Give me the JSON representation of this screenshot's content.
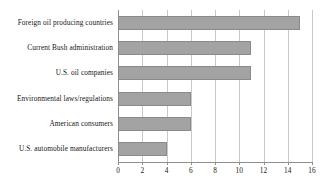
{
  "chart_data": {
    "type": "bar",
    "orientation": "horizontal",
    "title": "",
    "subtitle": "",
    "xlabel": "",
    "ylabel": "",
    "categories": [
      "Foreign oil producing countries",
      "Current Bush administration",
      "U.S. oil companies",
      "Environmental laws/regulations",
      "American consumers",
      "U.S. automobile manufacturers"
    ],
    "values": [
      15,
      11,
      11,
      6,
      6,
      4
    ],
    "xlim": [
      0,
      16
    ],
    "xticks": [
      0,
      2,
      4,
      6,
      8,
      10,
      12,
      14,
      16
    ],
    "xtick_labels": [
      "0",
      "2",
      "4",
      "6",
      "8",
      "10",
      "12",
      "14",
      "16"
    ],
    "grid": true,
    "grid_axis": "x",
    "legend": false,
    "legend_position": "none",
    "annotations": [],
    "series": [
      {
        "name": "",
        "values": [
          15,
          11,
          11,
          6,
          6,
          4
        ]
      }
    ],
    "colors": {
      "bar_fill": "#a3a3a3",
      "bar_border": "#8a8a8a",
      "gridline": "#c9c9c9",
      "axis": "#8f8f8f",
      "text": "#161616",
      "background": "#ffffff"
    }
  }
}
